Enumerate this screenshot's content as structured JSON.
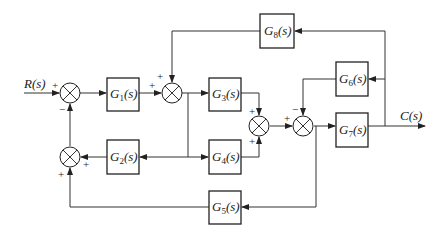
{
  "diagram": {
    "type": "block-diagram",
    "input": {
      "label": "R(s)"
    },
    "output": {
      "label": "C(s)"
    },
    "blocks": [
      {
        "id": "G1",
        "name": "G",
        "sub": "1",
        "suffix": "(s)"
      },
      {
        "id": "G2",
        "name": "G",
        "sub": "2",
        "suffix": "(s)"
      },
      {
        "id": "G3",
        "name": "G",
        "sub": "3",
        "suffix": "(s)"
      },
      {
        "id": "G4",
        "name": "G",
        "sub": "4",
        "suffix": "(s)"
      },
      {
        "id": "G5",
        "name": "G",
        "sub": "5",
        "suffix": "(s)"
      },
      {
        "id": "G6",
        "name": "G",
        "sub": "6",
        "suffix": "(s)"
      },
      {
        "id": "G7",
        "name": "G",
        "sub": "7",
        "suffix": "(s)"
      },
      {
        "id": "G8",
        "name": "G",
        "sub": "8",
        "suffix": "(s)"
      }
    ],
    "signs": {
      "sum1_in_r": "+",
      "sum1_in_bottom": "−",
      "sum2_in_left": "+",
      "sum2_in_top": "+",
      "sum3_in_right": "+",
      "sum3_in_bottom": "+",
      "sum4_in_top": "+",
      "sum4_in_bottom": "+",
      "sum5_in_left": "+",
      "sum5_in_top": "−"
    }
  }
}
